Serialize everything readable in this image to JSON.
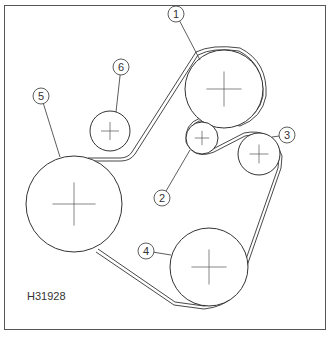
{
  "diagram": {
    "type": "belt-routing",
    "reference_code": "H31928",
    "frame_color": "#555555",
    "line_color": "#333333",
    "pulleys": [
      {
        "id": "1",
        "label": "1",
        "cx": 224,
        "cy": 89,
        "r": 39,
        "label_x": 176,
        "label_y": 14,
        "leader_to": [
          200,
          60
        ]
      },
      {
        "id": "2",
        "label": "2",
        "cx": 202,
        "cy": 138,
        "r": 16,
        "label_x": 162,
        "label_y": 198,
        "leader_to": [
          190,
          150
        ]
      },
      {
        "id": "3",
        "label": "3",
        "cx": 259,
        "cy": 154,
        "r": 21,
        "label_x": 287,
        "label_y": 135,
        "leader_to": [
          272,
          137
        ]
      },
      {
        "id": "4",
        "label": "4",
        "cx": 209,
        "cy": 267,
        "r": 39,
        "label_x": 146,
        "label_y": 251,
        "leader_to": [
          171,
          255
        ]
      },
      {
        "id": "5",
        "label": "5",
        "cx": 74,
        "cy": 204,
        "r": 48,
        "label_x": 41,
        "label_y": 96,
        "leader_to": [
          60,
          157
        ]
      },
      {
        "id": "6",
        "label": "6",
        "cx": 110,
        "cy": 131,
        "r": 20,
        "label_x": 121,
        "label_y": 67,
        "leader_to": [
          116,
          112
        ]
      }
    ]
  }
}
